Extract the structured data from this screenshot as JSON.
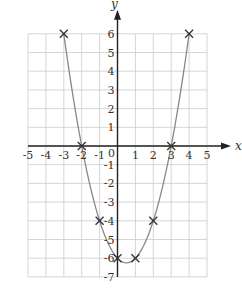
{
  "chart_data": {
    "type": "line",
    "title": "",
    "xlabel": "x",
    "ylabel": "y",
    "xlim": [
      -5,
      5
    ],
    "ylim": [
      -7,
      6
    ],
    "grid": true,
    "x_ticks": [
      -5,
      -4,
      -3,
      -2,
      -1,
      0,
      1,
      2,
      3,
      4,
      5
    ],
    "y_ticks": [
      -7,
      -6,
      -5,
      -4,
      -3,
      -2,
      -1,
      1,
      2,
      3,
      4,
      5,
      6
    ],
    "origin_label": "0",
    "series": [
      {
        "name": "y = x² − x − 6",
        "curve": "quadratic",
        "x": [
          -3,
          -2,
          -1,
          0,
          1,
          2,
          3,
          4
        ],
        "y": [
          6,
          0,
          -4,
          -6,
          -6,
          -4,
          0,
          6
        ],
        "marker": "x",
        "color": "#888888"
      }
    ],
    "colors": {
      "grid": "#cccccc",
      "axis": "#222222",
      "curve": "#888888",
      "marker": "#333333"
    }
  }
}
